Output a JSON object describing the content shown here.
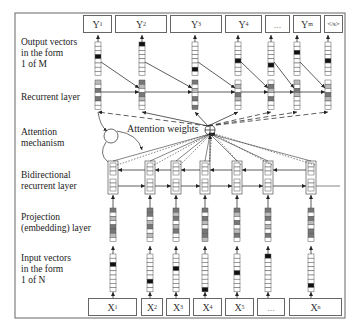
{
  "diagram": {
    "layers": {
      "output": "Output vectors\nin the form\n1 of M",
      "recurrent": "Recurrent layer",
      "attention": "Attention\nmechanism",
      "bidirectional": "Bidirectional\nrecurrent layer",
      "projection": "Projection\n(embedding) layer",
      "input": "Input vectors\nin the form\n1 of N"
    },
    "attention_label": "Attention weights",
    "outputs": [
      {
        "base": "Y",
        "sub": "1"
      },
      {
        "base": "Y",
        "sub": "2"
      },
      {
        "base": "Y",
        "sub": "3"
      },
      {
        "base": "Y",
        "sub": "4"
      },
      {
        "base": "...",
        "sub": ""
      },
      {
        "base": "Y",
        "sub": "m"
      },
      {
        "base": "</s>",
        "sub": ""
      }
    ],
    "inputs": [
      {
        "base": "X",
        "sub": "1"
      },
      {
        "base": "X",
        "sub": "2"
      },
      {
        "base": "X",
        "sub": "3"
      },
      {
        "base": "X",
        "sub": "4"
      },
      {
        "base": "X",
        "sub": "5"
      },
      {
        "base": "...",
        "sub": ""
      },
      {
        "base": "X",
        "sub": "n"
      }
    ],
    "colors": {
      "line": "#333333",
      "frame": "#666666",
      "one_hot": "#111111",
      "dark_cell": "#777777",
      "light_cell": "#bbbbbb"
    }
  }
}
